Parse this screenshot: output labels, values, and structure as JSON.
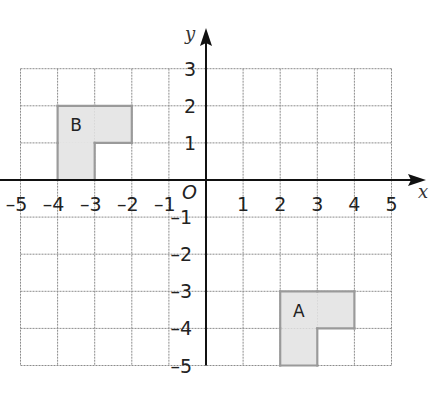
{
  "diagram": {
    "type": "coordinate-grid",
    "x_axis": {
      "label": "x",
      "min": -5,
      "max": 5,
      "ticks": [
        "-5",
        "-4",
        "-3",
        "-2",
        "-1",
        "1",
        "2",
        "3",
        "4",
        "5"
      ]
    },
    "y_axis": {
      "label": "y",
      "min": -5,
      "max": 3,
      "ticks": [
        "3",
        "2",
        "1",
        "-1",
        "-2",
        "-3",
        "-4",
        "-5"
      ]
    },
    "origin_label": "O",
    "shapes": [
      {
        "label": "B",
        "cells": [
          [
            -4,
            1
          ],
          [
            -3,
            1
          ],
          [
            -4,
            0
          ]
        ],
        "fill": "#e6e6e6",
        "outline": "#9a9a9a"
      },
      {
        "label": "A",
        "cells": [
          [
            2,
            -4
          ],
          [
            3,
            -4
          ],
          [
            2,
            -5
          ]
        ],
        "fill": "#e6e6e6",
        "outline": "#9a9a9a"
      }
    ]
  }
}
